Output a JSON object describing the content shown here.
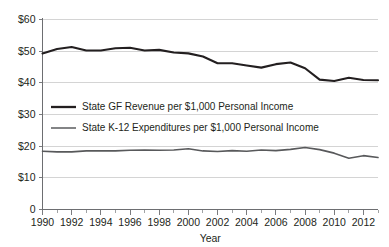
{
  "chart_data": {
    "type": "line",
    "title": "",
    "xlabel": "Year",
    "ylabel": "",
    "xlim": [
      1990,
      2013
    ],
    "ylim": [
      0,
      60
    ],
    "grid": true,
    "legend_position": "inside-upper-center",
    "x": [
      1990,
      1991,
      1992,
      1993,
      1994,
      1995,
      1996,
      1997,
      1998,
      1999,
      2000,
      2001,
      2002,
      2003,
      2004,
      2005,
      2006,
      2007,
      2008,
      2009,
      2010,
      2011,
      2012,
      2013
    ],
    "xtick_labels": [
      "1990",
      "1992",
      "1994",
      "1996",
      "1998",
      "2000",
      "2002",
      "2004",
      "2006",
      "2008",
      "2010",
      "2012"
    ],
    "xtick_values": [
      1990,
      1992,
      1994,
      1996,
      1998,
      2000,
      2002,
      2004,
      2006,
      2008,
      2010,
      2012
    ],
    "ytick_labels": [
      "0",
      "$10",
      "$20",
      "$30",
      "$40",
      "$50",
      "$60"
    ],
    "ytick_values": [
      0,
      10,
      20,
      30,
      40,
      50,
      60
    ],
    "series": [
      {
        "name": "State GF Revenue per $1,000 Personal Income",
        "color": "#231f20",
        "width": 2.1,
        "values": [
          49.3,
          50.7,
          51.3,
          50.2,
          50.2,
          50.9,
          51.1,
          50.2,
          50.4,
          49.6,
          49.3,
          48.3,
          46.2,
          46.2,
          45.5,
          44.8,
          45.9,
          46.4,
          44.6,
          41.0,
          40.6,
          41.6,
          40.9,
          40.8
        ],
        "values_detail": [
          49.3,
          50.7,
          51.3,
          50.2,
          50.2,
          50.9,
          51.1,
          50.2,
          50.4,
          49.6,
          49.3,
          48.3,
          46.2,
          46.2,
          45.5,
          44.8,
          45.9,
          46.4,
          44.6,
          41.0,
          40.6,
          41.6,
          40.9,
          40.8
        ]
      },
      {
        "name": "State K-12 Expenditures per $1,000 Personal Income",
        "color": "#58595b",
        "width": 1.6,
        "values": [
          18.4,
          18.2,
          18.2,
          18.5,
          18.5,
          18.5,
          18.7,
          18.8,
          18.7,
          18.8,
          19.2,
          18.5,
          18.3,
          18.6,
          18.4,
          18.8,
          18.6,
          19.0,
          19.6,
          18.9,
          17.8,
          16.2,
          17.0,
          16.4
        ]
      }
    ],
    "legend": [
      {
        "label": "State GF Revenue per $1,000 Personal Income",
        "color": "#231f20",
        "swatch": "thick-line"
      },
      {
        "label": "State K-12 Expenditures per $1,000 Personal Income",
        "color": "#6d6e71",
        "swatch": "thin-line"
      }
    ]
  }
}
